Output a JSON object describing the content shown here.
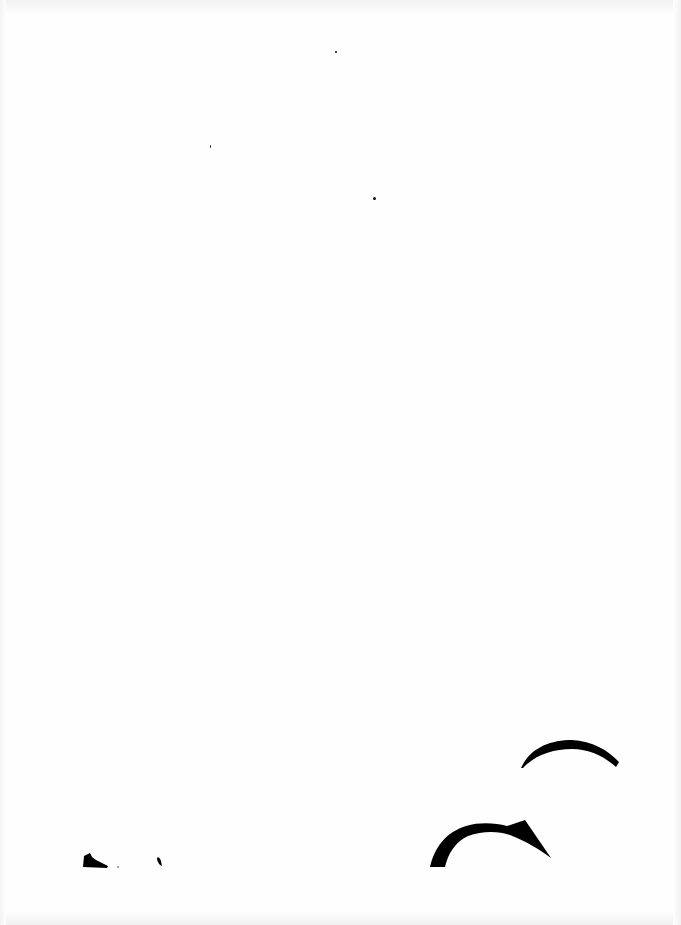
{
  "document": {
    "type": "scanned-page",
    "text": "",
    "description": "Mostly blank scanned page; partial black glyph fragments cut off along the lower edge"
  },
  "colors": {
    "paper": "#fefefe",
    "ink": "#000000",
    "scan_edge": "#f1f1f1"
  },
  "marks": [
    {
      "name": "speck-1",
      "x": 336,
      "y": 52
    },
    {
      "name": "speck-2",
      "x": 211,
      "y": 147
    },
    {
      "name": "speck-3",
      "x": 374,
      "y": 198
    }
  ]
}
